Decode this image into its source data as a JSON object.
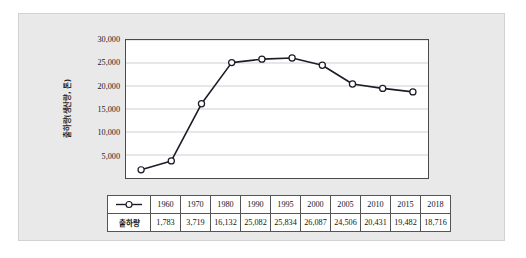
{
  "figure": {
    "y_axis_title": "출하량(생산량, 톤)",
    "series_label": "출하량",
    "legend_icon": "line-with-circle-marker"
  },
  "chart_data": {
    "type": "line",
    "title": "",
    "xlabel": "",
    "ylabel": "출하량(생산량, 톤)",
    "categories": [
      "1960",
      "1970",
      "1980",
      "1990",
      "1995",
      "2000",
      "2005",
      "2010",
      "2015",
      "2018"
    ],
    "values": [
      1783,
      3719,
      16132,
      25082,
      25834,
      26087,
      24506,
      20431,
      19482,
      18716
    ],
    "value_labels": [
      "1,783",
      "3,719",
      "16,132",
      "25,082",
      "25,834",
      "26,087",
      "24,506",
      "20,431",
      "19,482",
      "18,716"
    ],
    "series": [
      {
        "name": "출하량",
        "values": [
          1783,
          3719,
          16132,
          25082,
          25834,
          26087,
          24506,
          20431,
          19482,
          18716
        ]
      }
    ],
    "ylim": [
      0,
      30000
    ],
    "ytick_labels": [
      "30,000",
      "25,000",
      "20,000",
      "15,000",
      "10,000",
      "5,000"
    ],
    "yticks": [
      30000,
      25000,
      20000,
      15000,
      10000,
      5000
    ],
    "grid": "horizontal",
    "legend": "in-table",
    "line_color": "#1c1c28",
    "marker_fill": "#ffffff",
    "marker_edge": "#1c1c28",
    "grid_color": "#c9c9c9",
    "plot_border_color": "#4a4a4a",
    "panel_background": "#e9e9e9"
  },
  "table": {
    "columns": [
      "1960",
      "1970",
      "1980",
      "1990",
      "1995",
      "2000",
      "2005",
      "2010",
      "2015",
      "2018"
    ],
    "row_label": "출하량",
    "row_values": [
      "1,783",
      "3,719",
      "16,132",
      "25,082",
      "25,834",
      "26,087",
      "24,506",
      "20,431",
      "19,482",
      "18,716"
    ]
  }
}
